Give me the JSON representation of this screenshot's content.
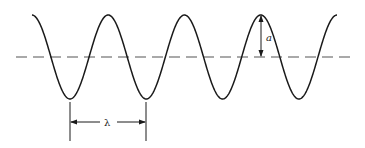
{
  "diagram": {
    "type": "sinusoidal-wave",
    "labels": {
      "amplitude": "a",
      "wavelength": "λ"
    },
    "colors": {
      "stroke": "#1a1a1a",
      "background": "#ffffff"
    }
  }
}
